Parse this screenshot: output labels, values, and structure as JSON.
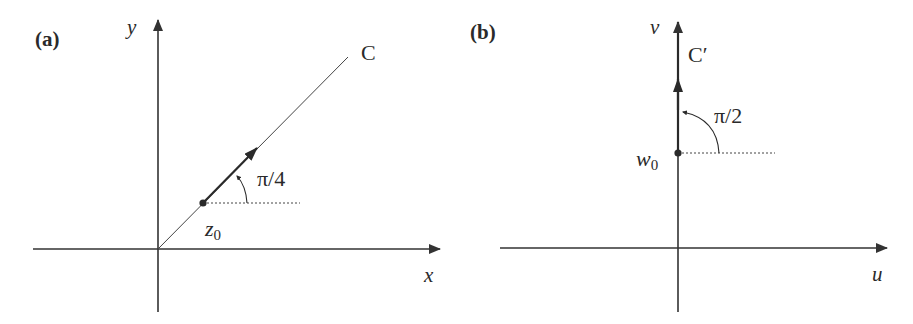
{
  "panels": [
    {
      "id": "a",
      "label": "(a)",
      "x_axis_label": "x",
      "y_axis_label": "y",
      "curve_label": "C",
      "point_label": "z",
      "point_subscript": "0",
      "angle_label": "π/4",
      "description": "Line C through origin at angle π/4; tangent direction at z0 shown"
    },
    {
      "id": "b",
      "label": "(b)",
      "x_axis_label": "u",
      "y_axis_label": "v",
      "curve_label": "C′",
      "point_label": "w",
      "point_subscript": "0",
      "angle_label": "π/2",
      "description": "Image curve C′ along the v-axis; tangent direction at w0 at angle π/2"
    }
  ],
  "colors": {
    "ink": "#2a2a2a",
    "axis": "#333333",
    "background": "#ffffff"
  }
}
